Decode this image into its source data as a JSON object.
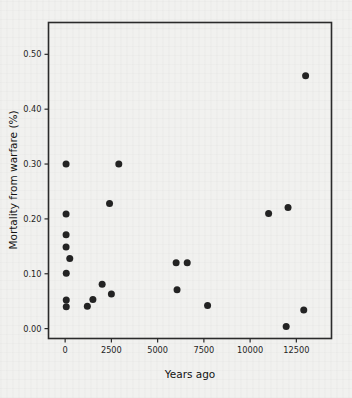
{
  "figure": {
    "background_color": "#f1f1ef",
    "marker_color": "#232323",
    "axis_color": "#2b2b2b"
  },
  "chart_data": {
    "type": "scatter",
    "title": "",
    "xlabel": "Years ago",
    "ylabel": "Mortality from warfare (%)",
    "xlim": [
      -900,
      14400
    ],
    "ylim": [
      -0.018,
      0.558
    ],
    "grid": false,
    "legend": null,
    "xticks": [
      0,
      2500,
      5000,
      7500,
      10000,
      12500
    ],
    "xtick_labels": [
      "0",
      "2500",
      "5000",
      "7500",
      "10000",
      "12500"
    ],
    "yticks": [
      0.0,
      0.1,
      0.2,
      0.3,
      0.4,
      0.5
    ],
    "ytick_labels": [
      "0.00",
      "0.10",
      "0.20",
      "0.30",
      "0.40",
      "0.50"
    ],
    "points": [
      {
        "x": 50,
        "y": 0.3
      },
      {
        "x": 50,
        "y": 0.209
      },
      {
        "x": 50,
        "y": 0.171
      },
      {
        "x": 50,
        "y": 0.149
      },
      {
        "x": 250,
        "y": 0.128
      },
      {
        "x": 60,
        "y": 0.101
      },
      {
        "x": 60,
        "y": 0.052
      },
      {
        "x": 60,
        "y": 0.04
      },
      {
        "x": 1200,
        "y": 0.041
      },
      {
        "x": 1500,
        "y": 0.053
      },
      {
        "x": 2000,
        "y": 0.081
      },
      {
        "x": 2400,
        "y": 0.228
      },
      {
        "x": 2500,
        "y": 0.063
      },
      {
        "x": 2900,
        "y": 0.3
      },
      {
        "x": 6000,
        "y": 0.12
      },
      {
        "x": 6050,
        "y": 0.071
      },
      {
        "x": 6600,
        "y": 0.12
      },
      {
        "x": 7700,
        "y": 0.042
      },
      {
        "x": 11000,
        "y": 0.21
      },
      {
        "x": 11950,
        "y": 0.004
      },
      {
        "x": 12050,
        "y": 0.221
      },
      {
        "x": 12900,
        "y": 0.034
      },
      {
        "x": 13000,
        "y": 0.461
      }
    ]
  }
}
